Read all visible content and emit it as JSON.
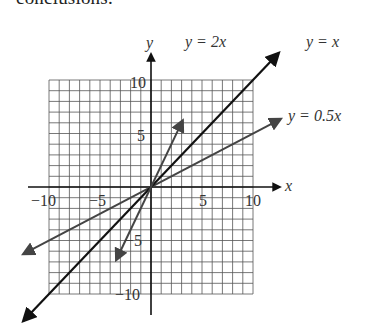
{
  "page": {
    "top_text": "conclusions."
  },
  "chart_data": {
    "type": "line",
    "title": "",
    "xlabel": "x",
    "ylabel": "y",
    "xlim": [
      -10,
      10
    ],
    "ylim": [
      -10,
      10
    ],
    "grid": true,
    "grid_step": 1,
    "x_ticks": [
      -10,
      -5,
      5,
      10
    ],
    "y_ticks": [
      10,
      5,
      -5,
      -10
    ],
    "x_tick_labels": [
      "−10",
      "−5",
      "5",
      "10"
    ],
    "y_tick_labels": [
      "10",
      "5",
      "−5",
      "−10"
    ],
    "series": [
      {
        "name": "y = 2x",
        "slope": 2,
        "x": [
          -3.4,
          0,
          3.1
        ],
        "y": [
          -6.8,
          0,
          6.2
        ],
        "color": "#444444"
      },
      {
        "name": "y = x",
        "slope": 1,
        "x": [
          -12.5,
          0,
          12.5
        ],
        "y": [
          -12.5,
          0,
          12.5
        ],
        "color": "#111111"
      },
      {
        "name": "y = 0.5x",
        "slope": 0.5,
        "x": [
          -12.5,
          0,
          12.7
        ],
        "y": [
          -6.25,
          0,
          6.35
        ],
        "color": "#444444"
      }
    ],
    "legend": "inline labels at line ends",
    "labels": {
      "line_2x": "y = 2x",
      "line_x": "y = x",
      "line_half_x": "y = 0.5x",
      "x_axis": "x",
      "y_axis": "y"
    }
  }
}
